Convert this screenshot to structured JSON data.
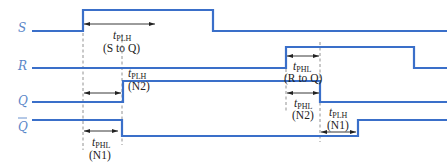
{
  "diagram": {
    "type": "timing-diagram",
    "wave_color": "#3a6fc9",
    "signals": [
      {
        "id": "S",
        "label": "S",
        "overbar": false
      },
      {
        "id": "R",
        "label": "R",
        "overbar": false
      },
      {
        "id": "Q",
        "label": "Q",
        "overbar": false
      },
      {
        "id": "Qbar",
        "label": "Q",
        "overbar": true
      }
    ],
    "annotations": [
      {
        "id": "tplh_s_to_q",
        "symbol": "t",
        "subscript": "PLH",
        "note": "(S to Q)"
      },
      {
        "id": "tplh_n2",
        "symbol": "t",
        "subscript": "PLH",
        "note": "(N2)"
      },
      {
        "id": "tphl_n1",
        "symbol": "t",
        "subscript": "PHL",
        "note": "(N1)"
      },
      {
        "id": "tphl_r_to_q",
        "symbol": "t",
        "subscript": "PHL",
        "note": "(R to Q)"
      },
      {
        "id": "tphl_n2",
        "symbol": "t",
        "subscript": "PHL",
        "note": "(N2)"
      },
      {
        "id": "tplh_n1",
        "symbol": "t",
        "subscript": "PLH",
        "note": "(N1)"
      }
    ]
  }
}
